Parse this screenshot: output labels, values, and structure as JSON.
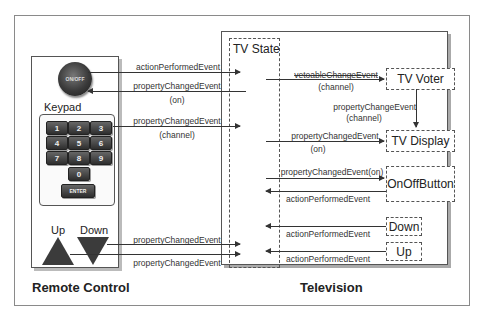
{
  "remote": {
    "title": "Remote Control",
    "onoff_label": "ON/OFF",
    "keypad_label": "Keypad",
    "keys": [
      "1",
      "2",
      "3",
      "4",
      "5",
      "6",
      "7",
      "8",
      "9",
      "0"
    ],
    "enter_label": "ENTER",
    "up_label": "Up",
    "down_label": "Down"
  },
  "television": {
    "title": "Television",
    "tv_state_label": "TV State",
    "components": {
      "tv_voter": "TV Voter",
      "tv_display": "TV Display",
      "onoff_button": "OnOffButton",
      "down": "Down",
      "up": "Up"
    }
  },
  "edges": {
    "remote_onoff_action": "actionPerformedEvent",
    "remote_onoff_property": "propertyChangedEvent",
    "remote_onoff_property_sub": "(on)",
    "remote_keypad_property": "propertyChangedEvent",
    "remote_keypad_property_sub": "(channel)",
    "remote_down_property": "propertyChangedEvent",
    "remote_up_property": "propertyChangedEvent",
    "voter_vetoable": "vetoableChangeEvent",
    "voter_vetoable_sub": "(channel)",
    "voter_to_display": "propertyChangeEvent",
    "voter_to_display_sub": "(channel)",
    "display_property": "propertyChangedEvent",
    "display_property_sub": "(on)",
    "onoff_property": "propertyChangedEvent(on)",
    "onoff_action": "actionPerformedEvent",
    "down_action": "actionPerformedEvent",
    "up_action": "actionPerformedEvent"
  }
}
